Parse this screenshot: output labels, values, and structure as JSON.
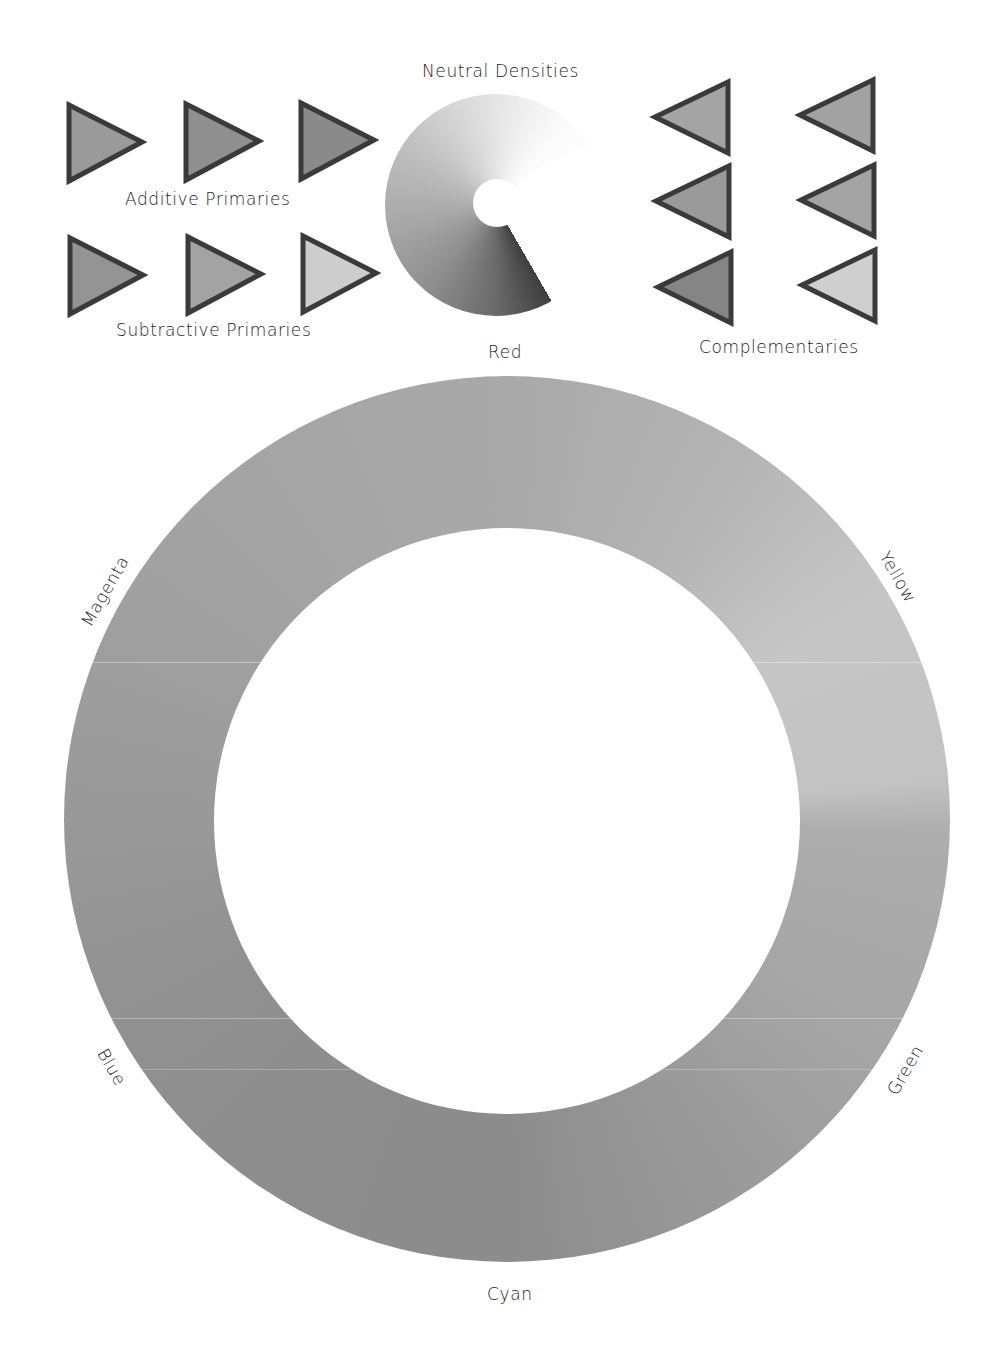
{
  "groups": {
    "additive_primaries": {
      "label": "Additive Primaries",
      "swatches": [
        {
          "name": "additive-1",
          "fill": "#9a9a9a",
          "direction": "right"
        },
        {
          "name": "additive-2",
          "fill": "#8f8f8f",
          "direction": "right"
        },
        {
          "name": "additive-3",
          "fill": "#8a8a8a",
          "direction": "right"
        }
      ]
    },
    "subtractive_primaries": {
      "label": "Subtractive Primaries",
      "swatches": [
        {
          "name": "subtractive-1",
          "fill": "#949494",
          "direction": "right"
        },
        {
          "name": "subtractive-2",
          "fill": "#a3a3a3",
          "direction": "right"
        },
        {
          "name": "subtractive-3",
          "fill": "#cdcdcd",
          "direction": "right"
        }
      ]
    },
    "neutral_densities": {
      "label": "Neutral Densities"
    },
    "complementaries": {
      "label": "Complementaries",
      "swatches": [
        {
          "name": "complementary-1-1",
          "fill": "#a4a4a4",
          "direction": "left"
        },
        {
          "name": "complementary-1-2",
          "fill": "#a2a2a2",
          "direction": "left"
        },
        {
          "name": "complementary-2-1",
          "fill": "#9a9a9a",
          "direction": "left"
        },
        {
          "name": "complementary-2-2",
          "fill": "#a3a3a3",
          "direction": "left"
        },
        {
          "name": "complementary-3-1",
          "fill": "#858585",
          "direction": "left"
        },
        {
          "name": "complementary-3-2",
          "fill": "#cfcfcf",
          "direction": "left"
        }
      ]
    }
  },
  "color_wheel": {
    "labels": {
      "top": "Red",
      "upper_right": "Yellow",
      "lower_right": "Green",
      "bottom": "Cyan",
      "lower_left": "Blue",
      "upper_left": "Magenta"
    },
    "tones": {
      "red": "#a9a9a9",
      "yellow": "#c9c9c9",
      "green": "#a4a4a4",
      "cyan": "#8b8b8b",
      "blue": "#8e8e8e",
      "magenta": "#a0a0a0"
    }
  },
  "colors": {
    "outline": "#3a3a3a",
    "text": "#1c1c1c",
    "background": "#ffffff"
  }
}
